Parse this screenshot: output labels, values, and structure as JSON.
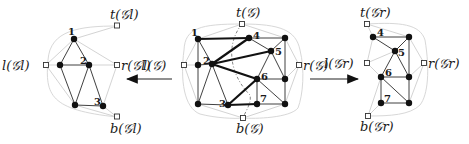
{
  "diagram": {
    "left_graph": {
      "name": "G_l",
      "terminals": {
        "top": "t(𝒢l)",
        "left": "l(𝒢l)",
        "right": "r(𝒢l)",
        "bottom": "b(𝒢l)"
      },
      "vertex_labels": [
        "1",
        "2",
        "3"
      ]
    },
    "center_graph": {
      "name": "G",
      "terminals": {
        "top": "t(𝒢)",
        "left": "l(𝒢)",
        "right": "r(𝒢)",
        "bottom": "b(𝒢)"
      },
      "vertex_labels": [
        "1",
        "2",
        "3",
        "4",
        "5",
        "6",
        "7"
      ]
    },
    "right_graph": {
      "name": "G_r",
      "terminals": {
        "top": "t(𝒢r)",
        "left": "l(𝒢r)",
        "right": "r(𝒢r)",
        "bottom": "b(𝒢r)"
      },
      "vertex_labels": [
        "4",
        "5",
        "6",
        "7"
      ]
    },
    "arrows": [
      {
        "from": "G",
        "to": "G_l",
        "direction": "left"
      },
      {
        "from": "G",
        "to": "G_r",
        "direction": "right"
      }
    ]
  }
}
